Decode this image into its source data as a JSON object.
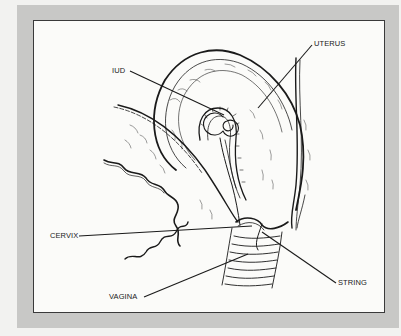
{
  "figure": {
    "colors": {
      "page": "#f2f2f0",
      "frame": "#c8c8c6",
      "panel": "#fbfbf9",
      "ink": "#1a1a1a"
    },
    "labels": [
      {
        "id": "iud",
        "text": "IUD"
      },
      {
        "id": "uterus",
        "text": "UTERUS"
      },
      {
        "id": "cervix",
        "text": "CERVIX"
      },
      {
        "id": "vagina",
        "text": "VAGINA"
      },
      {
        "id": "string",
        "text": "STRING"
      }
    ]
  }
}
